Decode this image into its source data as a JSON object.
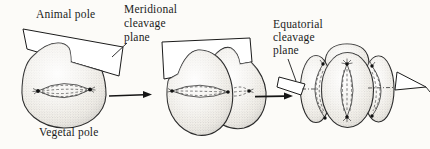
{
  "figure": {
    "kind": "biology-textbook-diagram",
    "topic": "cleavage planes of an early embryo"
  },
  "labels": {
    "animal_pole": "Animal pole",
    "vegetal_pole": "Vegetal pole",
    "meridional": [
      "Meridional",
      "cleavage",
      "plane"
    ],
    "equatorial": [
      "Equatorial",
      "cleavage",
      "plane"
    ]
  },
  "icons": {
    "sequence_arrow": "right-arrow"
  },
  "colors": {
    "ink": "#1b1b1b",
    "cell_fill": "#f3f0e9",
    "plane_fill": "#ffffff",
    "background": "#fcfbf8"
  }
}
